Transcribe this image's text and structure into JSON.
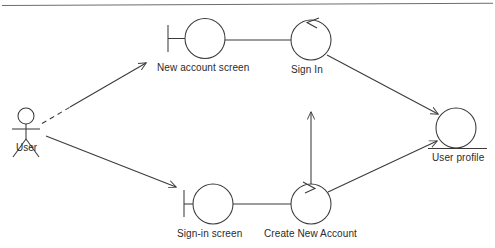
{
  "diagram": {
    "type": "uml-usecase-state",
    "stroke_color": "#3a3a3a",
    "text_color": "#2b2b2b",
    "background": "#ffffff",
    "top_rule": {
      "name": "top-horizontal-rule",
      "x1": 2,
      "y1": 5,
      "x2": 493,
      "y2": 3
    },
    "actor": {
      "name": "User",
      "label": "User",
      "label_x": 16,
      "label_y": 150,
      "head_cx": 26,
      "head_cy": 116,
      "head_r": 8,
      "body_top_y": 124,
      "body_bottom_y": 139,
      "arms_y": 129,
      "arm_left_x": 13,
      "arm_right_x": 39,
      "leg_left_x": 13,
      "leg_right_x": 39,
      "leg_bottom_y": 157
    },
    "nodes": [
      {
        "id": "new-account-screen",
        "label": "New account screen",
        "cx": 205,
        "cy": 38,
        "r": 20,
        "label_x": 157,
        "label_y": 62,
        "boundary_bar": {
          "x": 168,
          "y_top": 25,
          "y_bottom": 52,
          "stem_to_x": 185
        }
      },
      {
        "id": "sign-in",
        "label": "Sign In",
        "cx": 311,
        "cy": 40,
        "r": 20,
        "label_x": 291,
        "label_y": 64,
        "boundary_bar": null
      },
      {
        "id": "sign-in-screen",
        "label": "Sign-in screen",
        "cx": 213,
        "cy": 204,
        "r": 20,
        "label_x": 177,
        "label_y": 228,
        "boundary_bar": {
          "x": 184,
          "y_top": 190,
          "y_bottom": 217,
          "stem_to_x": 193
        }
      },
      {
        "id": "create-new-account",
        "label": "Create New Account",
        "cx": 311,
        "cy": 204,
        "r": 20,
        "label_x": 264,
        "label_y": 228,
        "boundary_bar": null
      },
      {
        "id": "user-profile",
        "label": "User profile",
        "cx": 456,
        "cy": 128,
        "r": 20,
        "label_x": 432,
        "label_y": 152,
        "underline": {
          "x1": 428,
          "y1": 148,
          "x2": 487,
          "y2": 148
        },
        "boundary_bar": null
      }
    ],
    "edges": [
      {
        "id": "user-to-new-account-screen",
        "from": "User",
        "to": "New account screen",
        "style": "dashed-to-solid",
        "arrow": "open",
        "x1": 42,
        "y1": 123,
        "x2": 146,
        "y2": 63
      },
      {
        "id": "user-to-sign-in-screen",
        "from": "User",
        "to": "Sign-in screen",
        "style": "solid",
        "arrow": "open",
        "x1": 46,
        "y1": 136,
        "x2": 176,
        "y2": 187
      },
      {
        "id": "new-account-screen-to-sign-in",
        "from": "New account screen",
        "to": "Sign In",
        "style": "solid",
        "arrow": "none",
        "x1": 225,
        "y1": 40,
        "x2": 291,
        "y2": 40
      },
      {
        "id": "sign-in-screen-to-create-new-account",
        "from": "Sign-in screen",
        "to": "Create New Account",
        "style": "solid",
        "arrow": "none",
        "x1": 233,
        "y1": 204,
        "x2": 291,
        "y2": 204
      },
      {
        "id": "create-new-account-to-sign-in",
        "from": "Create New Account",
        "to": "Sign In",
        "style": "solid",
        "arrow": "open",
        "x1": 311,
        "y1": 184,
        "x2": 311,
        "y2": 112
      },
      {
        "id": "sign-in-to-user-profile",
        "from": "Sign In",
        "to": "User profile",
        "style": "solid",
        "arrow": "open",
        "x1": 327,
        "y1": 55,
        "x2": 440,
        "y2": 115
      },
      {
        "id": "create-new-account-to-user-profile",
        "from": "Create New Account",
        "to": "User profile",
        "style": "solid",
        "arrow": "open",
        "x1": 328,
        "y1": 192,
        "x2": 440,
        "y2": 140
      },
      {
        "id": "sign-in-self-loop-arrow",
        "from": "Sign In",
        "to": "Sign In",
        "style": "arrowhead-only",
        "arrow": "open",
        "note": "arrowhead on upper-left of Sign In circle"
      },
      {
        "id": "create-new-account-incoming-arrowhead",
        "from": "User profile",
        "to": "Create New Account",
        "style": "arrowhead-only",
        "arrow": "open",
        "note": "arrowhead on upper-right of Create New Account circle"
      }
    ]
  }
}
